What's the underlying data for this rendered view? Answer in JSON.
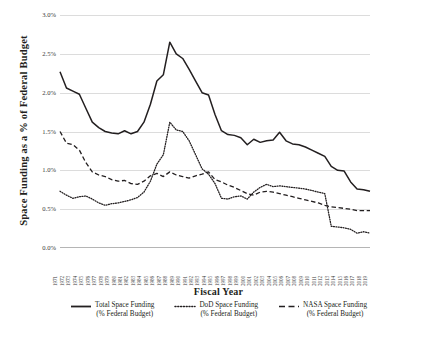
{
  "chart_data": {
    "type": "line",
    "title": "",
    "xlabel": "Fiscal Year",
    "ylabel": "Space Funding as a % of Federal Budget",
    "ylim": [
      0.0,
      3.0
    ],
    "ytick_labels": [
      "3.0%",
      "2.5%",
      "2.0%",
      "1.5%",
      "1.0%",
      "0.5%",
      "0.0%"
    ],
    "ytick_values": [
      3.0,
      2.5,
      2.0,
      1.5,
      1.0,
      0.5,
      0.0
    ],
    "grid": true,
    "legend_position": "bottom",
    "categories": [
      "1971",
      "1972",
      "1973",
      "1974",
      "1975",
      "1976",
      "1977",
      "1978",
      "1979",
      "1980",
      "1981",
      "1982",
      "1983",
      "1984",
      "1985",
      "1986",
      "1987",
      "1988",
      "1989",
      "1990",
      "1991",
      "1992",
      "1993",
      "1994",
      "1995",
      "1996",
      "1997",
      "1998",
      "1999",
      "2000",
      "2001",
      "2002",
      "2003",
      "2004",
      "2005",
      "2006",
      "2007",
      "2008",
      "2009",
      "2010",
      "2011",
      "2012",
      "2013",
      "2014",
      "2015",
      "2016",
      "2017",
      "2018",
      "2019"
    ],
    "series": [
      {
        "name": "Total Space Funding",
        "sublabel": "(% Federal Budget)",
        "style": "solid",
        "color": "#231f20",
        "values": [
          2.27,
          2.06,
          2.02,
          1.98,
          1.8,
          1.62,
          1.55,
          1.5,
          1.48,
          1.47,
          1.51,
          1.47,
          1.5,
          1.62,
          1.85,
          2.15,
          2.23,
          2.65,
          2.5,
          2.44,
          2.3,
          2.15,
          2.0,
          1.97,
          1.72,
          1.51,
          1.46,
          1.45,
          1.42,
          1.33,
          1.4,
          1.36,
          1.38,
          1.39,
          1.49,
          1.38,
          1.34,
          1.33,
          1.3,
          1.26,
          1.22,
          1.18,
          1.05,
          1.0,
          0.99,
          0.85,
          0.76,
          0.75,
          0.73
        ]
      },
      {
        "name": "DoD Space Funding",
        "sublabel": "(% Federal Budget)",
        "style": "dotted",
        "color": "#231f20",
        "values": [
          0.73,
          0.68,
          0.64,
          0.66,
          0.67,
          0.63,
          0.58,
          0.55,
          0.57,
          0.58,
          0.6,
          0.62,
          0.65,
          0.72,
          0.86,
          1.08,
          1.2,
          1.62,
          1.52,
          1.5,
          1.38,
          1.2,
          1.02,
          0.95,
          0.83,
          0.64,
          0.63,
          0.66,
          0.67,
          0.63,
          0.72,
          0.78,
          0.82,
          0.79,
          0.8,
          0.79,
          0.78,
          0.77,
          0.76,
          0.74,
          0.72,
          0.7,
          0.28,
          0.27,
          0.26,
          0.24,
          0.19,
          0.21,
          0.19
        ]
      },
      {
        "name": "NASA Space Funding",
        "sublabel": "(% Federal Budget)",
        "style": "dashed",
        "color": "#231f20",
        "values": [
          1.5,
          1.35,
          1.33,
          1.26,
          1.1,
          0.98,
          0.94,
          0.92,
          0.88,
          0.86,
          0.87,
          0.83,
          0.82,
          0.86,
          0.93,
          0.96,
          0.92,
          0.98,
          0.94,
          0.92,
          0.9,
          0.93,
          0.95,
          0.98,
          0.88,
          0.85,
          0.81,
          0.78,
          0.74,
          0.7,
          0.68,
          0.72,
          0.73,
          0.72,
          0.7,
          0.68,
          0.66,
          0.64,
          0.62,
          0.6,
          0.58,
          0.55,
          0.53,
          0.52,
          0.51,
          0.5,
          0.48,
          0.48,
          0.48
        ]
      }
    ]
  },
  "legend": {
    "items": [
      {
        "label": "Total Space Funding",
        "sublabel": "(% Federal Budget)"
      },
      {
        "label": "DoD Space Funding",
        "sublabel": "(% Federal Budget)"
      },
      {
        "label": "NASA Space Funding",
        "sublabel": "(% Federal Budget)"
      }
    ]
  }
}
